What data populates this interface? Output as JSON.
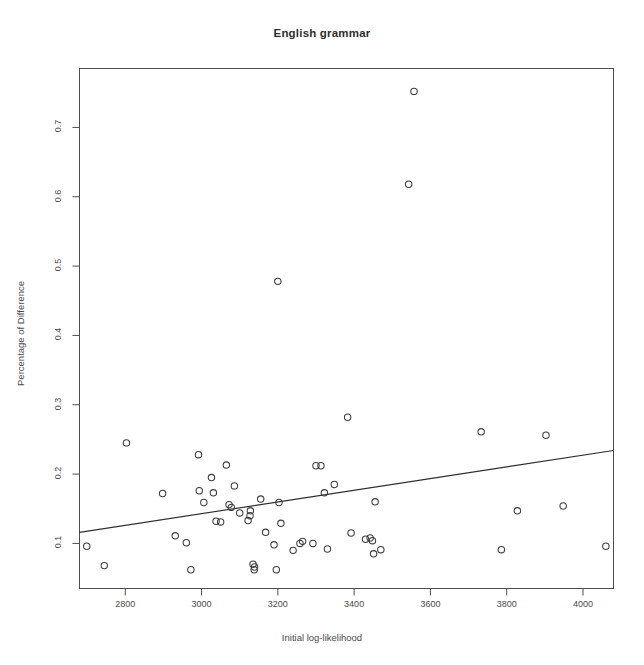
{
  "chart_data": {
    "type": "scatter",
    "title": "English grammar",
    "xlabel": "Initial log-likelihood",
    "ylabel": "Percentage of Difference",
    "xlim": [
      2680,
      4080
    ],
    "ylim": [
      0.035,
      0.785
    ],
    "xticks": [
      2800,
      3000,
      3200,
      3400,
      3600,
      3800,
      4000
    ],
    "yticks": [
      0.1,
      0.2,
      0.3,
      0.4,
      0.5,
      0.6,
      0.7
    ],
    "grid": false,
    "legend": null,
    "marker": "open-circle",
    "point_color": "#3c3c3c",
    "line_color": "#2e2e2e",
    "points": [
      {
        "x": 2699,
        "y": 0.096
      },
      {
        "x": 2745,
        "y": 0.068
      },
      {
        "x": 2803,
        "y": 0.245
      },
      {
        "x": 2898,
        "y": 0.172
      },
      {
        "x": 2931,
        "y": 0.111
      },
      {
        "x": 2960,
        "y": 0.101
      },
      {
        "x": 2972,
        "y": 0.062
      },
      {
        "x": 2992,
        "y": 0.228
      },
      {
        "x": 2994,
        "y": 0.176
      },
      {
        "x": 3006,
        "y": 0.159
      },
      {
        "x": 3026,
        "y": 0.195
      },
      {
        "x": 3031,
        "y": 0.173
      },
      {
        "x": 3038,
        "y": 0.132
      },
      {
        "x": 3050,
        "y": 0.131
      },
      {
        "x": 3065,
        "y": 0.213
      },
      {
        "x": 3072,
        "y": 0.156
      },
      {
        "x": 3078,
        "y": 0.152
      },
      {
        "x": 3086,
        "y": 0.183
      },
      {
        "x": 3100,
        "y": 0.144
      },
      {
        "x": 3122,
        "y": 0.133
      },
      {
        "x": 3127,
        "y": 0.14
      },
      {
        "x": 3128,
        "y": 0.147
      },
      {
        "x": 3135,
        "y": 0.07
      },
      {
        "x": 3138,
        "y": 0.062
      },
      {
        "x": 3139,
        "y": 0.066
      },
      {
        "x": 3155,
        "y": 0.164
      },
      {
        "x": 3168,
        "y": 0.116
      },
      {
        "x": 3190,
        "y": 0.098
      },
      {
        "x": 3196,
        "y": 0.062
      },
      {
        "x": 3200,
        "y": 0.478
      },
      {
        "x": 3203,
        "y": 0.159
      },
      {
        "x": 3208,
        "y": 0.129
      },
      {
        "x": 3240,
        "y": 0.09
      },
      {
        "x": 3258,
        "y": 0.1
      },
      {
        "x": 3265,
        "y": 0.103
      },
      {
        "x": 3292,
        "y": 0.1
      },
      {
        "x": 3300,
        "y": 0.212
      },
      {
        "x": 3313,
        "y": 0.212
      },
      {
        "x": 3322,
        "y": 0.173
      },
      {
        "x": 3330,
        "y": 0.092
      },
      {
        "x": 3348,
        "y": 0.185
      },
      {
        "x": 3383,
        "y": 0.282
      },
      {
        "x": 3392,
        "y": 0.115
      },
      {
        "x": 3430,
        "y": 0.106
      },
      {
        "x": 3442,
        "y": 0.108
      },
      {
        "x": 3448,
        "y": 0.104
      },
      {
        "x": 3451,
        "y": 0.085
      },
      {
        "x": 3455,
        "y": 0.16
      },
      {
        "x": 3470,
        "y": 0.091
      },
      {
        "x": 3543,
        "y": 0.618
      },
      {
        "x": 3557,
        "y": 0.752
      },
      {
        "x": 3733,
        "y": 0.261
      },
      {
        "x": 3786,
        "y": 0.091
      },
      {
        "x": 3828,
        "y": 0.147
      },
      {
        "x": 3903,
        "y": 0.256
      },
      {
        "x": 3948,
        "y": 0.154
      },
      {
        "x": 4060,
        "y": 0.096
      }
    ],
    "fit_line": {
      "type": "linear-regression",
      "x_start": 2680,
      "y_start": 0.116,
      "x_end": 4080,
      "y_end": 0.234
    }
  }
}
